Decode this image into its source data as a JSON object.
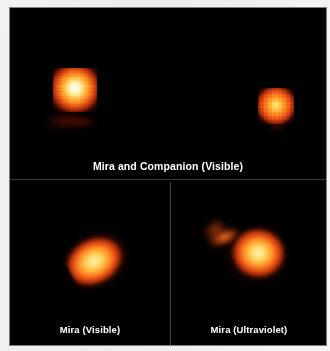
{
  "figure": {
    "background_color": "#f1f1ef",
    "plate_color": "#000000",
    "caption_text_color": "#ffffff"
  },
  "panels": [
    {
      "id": "top",
      "caption": "Mira and Companion (Visible)",
      "wavelength": "Visible",
      "layout": "full-width top panel",
      "objects": [
        {
          "name": "Mira",
          "position": "left",
          "appearance": "pixelated point source, white-hot core with yellow-orange halo",
          "core_color": "#fffdf2",
          "halo_color": "#f2641a"
        },
        {
          "name": "Companion",
          "position": "right",
          "appearance": "pixelated point source, smaller, orange core without white center",
          "core_color": "#ffcf4e",
          "halo_color": "#bb310c"
        }
      ]
    },
    {
      "id": "bottom-left",
      "caption": "Mira (Visible)",
      "wavelength": "Visible",
      "layout": "bottom-left panel",
      "objects": [
        {
          "name": "Mira",
          "appearance": "resolved elongated disc tilted toward upper-right, yellow core fading to orange-red",
          "core_color": "#fff0a8",
          "halo_color": "#b5300c"
        }
      ]
    },
    {
      "id": "bottom-right",
      "caption": "Mira (Ultraviolet)",
      "wavelength": "Ultraviolet",
      "layout": "bottom-right panel",
      "objects": [
        {
          "name": "Mira",
          "appearance": "resolved disc with a hook-shaped plume extending to the upper-left, yellow core fading to orange-red",
          "core_color": "#fff4b6",
          "halo_color": "#b8320c"
        }
      ]
    }
  ]
}
